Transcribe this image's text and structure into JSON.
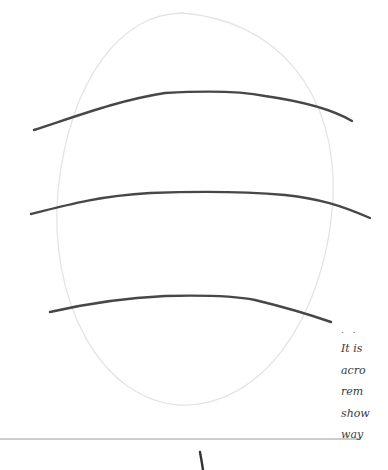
{
  "page": {
    "type": "illustrated-document-page",
    "background": "#ffffff"
  },
  "illustration": {
    "shape": "oval",
    "oval_color": "#e6e6e6",
    "stroke_color": "#444444",
    "curved_lines_count": 3
  },
  "separator": {
    "color": "#999999"
  },
  "side_text": {
    "marker": ". .",
    "lines": [
      "It is",
      "acro",
      "rem",
      "show",
      "way"
    ]
  }
}
